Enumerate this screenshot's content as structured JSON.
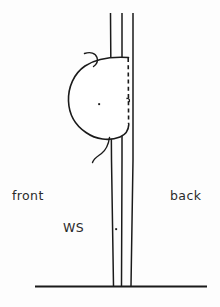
{
  "figure": {
    "type": "technical-line-diagram",
    "background_color": "#fdfdfd",
    "ink_color": "#1a1a1a",
    "labels": {
      "front": "front",
      "back": "back",
      "ws": "WS"
    },
    "parts": {
      "post_name": "vertical-post",
      "mass_name": "rounded-mass",
      "attachment_name": "dashed-attachment-line",
      "ground_name": "ground-line",
      "hook_top_name": "upper-curved-hook",
      "hook_bottom_name": "lower-curved-hook",
      "dot_mass_name": "mass-center-dot",
      "dot_post_name": "post-marker-dot"
    },
    "geometry": {
      "post_lines_x": [
        110,
        122,
        133
      ],
      "post_top_y": 13,
      "ground_y": 286,
      "ground_x_start": 35,
      "ground_x_end": 207,
      "mass_left_x": 68,
      "mass_top_y": 57,
      "mass_bottom_y": 140,
      "dashed_line_x": 128,
      "dashed_top_y": 58,
      "dashed_bottom_y": 124,
      "mass_dot": [
        99,
        104
      ],
      "post_dot": [
        116,
        229
      ]
    }
  }
}
